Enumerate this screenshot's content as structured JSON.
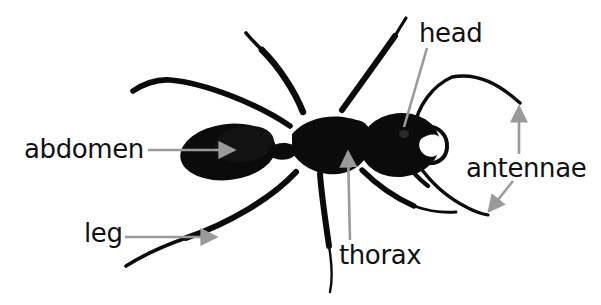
{
  "figure": {
    "subject": "ant",
    "view": "dorsal",
    "background_color": "#ffffff",
    "body_color": "#0b0b0b",
    "leader_line_color": "#9a9a9a",
    "label_text_color": "#111111"
  },
  "labels": [
    {
      "id": "abdomen",
      "text": "abdomen",
      "x": 24,
      "y": 136,
      "leader": {
        "type": "arrow",
        "from": [
          148,
          150
        ],
        "to": [
          234,
          150
        ],
        "direction": "right"
      }
    },
    {
      "id": "leg",
      "text": "leg",
      "x": 84,
      "y": 220,
      "leader": {
        "type": "arrow",
        "from": [
          125,
          237
        ],
        "to": [
          216,
          237
        ],
        "direction": "right"
      }
    },
    {
      "id": "thorax",
      "text": "thorax",
      "x": 339,
      "y": 242,
      "leader": {
        "type": "arrow",
        "from": [
          350,
          240
        ],
        "to": [
          348,
          152
        ],
        "direction": "up"
      }
    },
    {
      "id": "head",
      "text": "head",
      "x": 419,
      "y": 20,
      "leader": {
        "type": "line",
        "from": [
          427,
          48
        ],
        "to": [
          404,
          127
        ],
        "direction": "none"
      }
    },
    {
      "id": "antennae",
      "text": "antennae",
      "x": 466,
      "y": 155,
      "leader": {
        "type": "arrow",
        "from": [
          519,
          154
        ],
        "to": [
          519,
          107
        ],
        "direction": "up"
      },
      "leader2": {
        "type": "arrow",
        "from": [
          513,
          181
        ],
        "to": [
          487,
          213
        ],
        "direction": "down-left"
      }
    }
  ],
  "anatomy_parts": [
    {
      "name": "head",
      "count": 1
    },
    {
      "name": "thorax",
      "count": 1
    },
    {
      "name": "abdomen",
      "count": 1
    },
    {
      "name": "antennae",
      "count": 2
    },
    {
      "name": "leg",
      "count": 6
    }
  ]
}
